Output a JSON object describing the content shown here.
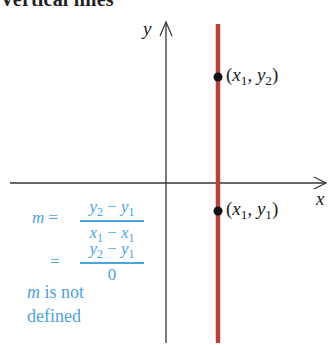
{
  "header": {
    "title": "Vertical lines"
  },
  "axes": {
    "x_label": "x",
    "y_label": "y"
  },
  "points": [
    {
      "name": "upper",
      "label": "(x1, y2)",
      "x_var": "x",
      "x_sub": "1",
      "y_var": "y",
      "y_sub": "2"
    },
    {
      "name": "lower",
      "label": "(x1, y1)",
      "x_var": "x",
      "x_sub": "1",
      "y_var": "y",
      "y_sub": "1"
    }
  ],
  "formula": {
    "line1": {
      "lhs": "m =",
      "numerator": "y2 − y1",
      "denominator": "x1 − x1"
    },
    "line2": {
      "lhs": "=",
      "numerator": "y2 − y1",
      "denominator": "0"
    },
    "conclusion_line1": "m is not",
    "conclusion_line2": "defined"
  },
  "colors": {
    "vertical_line": "#b5433a",
    "axes": "#333333",
    "formula": "#4aa3df",
    "point": "#111111"
  }
}
